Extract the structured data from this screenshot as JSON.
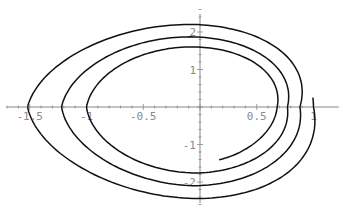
{
  "chart_data": {
    "type": "line",
    "subtype": "parametric-spiral",
    "title": "",
    "xlabel": "",
    "ylabel": "",
    "xlim": [
      -1.75,
      1.25
    ],
    "ylim": [
      -2.9,
      2.9
    ],
    "grid": false,
    "legend": null,
    "x_ticks": [
      {
        "value": -1.5,
        "label": "-1.5"
      },
      {
        "value": -1,
        "label": "-1"
      },
      {
        "value": -0.5,
        "label": "-0.5"
      },
      {
        "value": 0.5,
        "label": "0.5"
      },
      {
        "value": 1,
        "label": "1"
      }
    ],
    "y_ticks": [
      {
        "value": 2,
        "label": "2"
      },
      {
        "value": 1,
        "label": "1"
      },
      {
        "value": -1,
        "label": "-1"
      },
      {
        "value": -2,
        "label": "-2"
      }
    ],
    "series": [
      {
        "name": "spiral",
        "color": "#111111",
        "start_point": [
          0.45,
          -1.05
        ],
        "end_point": [
          1.0,
          0.13
        ],
        "right_crossings": [
          0.68,
          0.77,
          0.88
        ],
        "top_crossings": [
          1.6,
          1.87,
          2.2
        ],
        "left_crossings": [
          -1.0,
          -1.22,
          -1.52
        ],
        "bottom_crossings": [
          -1.76,
          -2.1,
          -2.44
        ],
        "key_points": [
          [
            0.45,
            -1.05
          ],
          [
            0.68,
            0.0
          ],
          [
            0.0,
            1.6
          ],
          [
            -1.0,
            0.0
          ],
          [
            0.0,
            -1.76
          ],
          [
            0.77,
            0.0
          ],
          [
            0.0,
            1.87
          ],
          [
            -1.22,
            0.0
          ],
          [
            0.0,
            -2.1
          ],
          [
            0.88,
            0.0
          ],
          [
            0.0,
            2.2
          ],
          [
            -1.52,
            0.0
          ],
          [
            0.0,
            -2.44
          ],
          [
            1.0,
            0.13
          ]
        ]
      }
    ]
  },
  "axes": {
    "origin_px": [
      200,
      107
    ],
    "x_scale_px": 113.5,
    "y_scale_px": 37.5,
    "color": "#888888"
  }
}
